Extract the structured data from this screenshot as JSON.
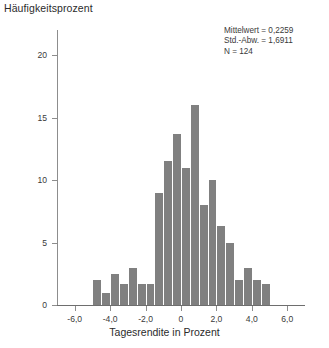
{
  "chart_data": {
    "type": "bar",
    "title": "",
    "subtitle": "",
    "ylabel": "Häufigkeitsprozent",
    "xlabel": "Tagesrendite in Prozent",
    "ylim": [
      0,
      22
    ],
    "xlim": [
      -7.0,
      7.0
    ],
    "grid": false,
    "legend": null,
    "y_ticks": [
      0,
      5,
      10,
      15,
      20
    ],
    "y_tick_labels": [
      "0",
      "5",
      "10",
      "15",
      "20"
    ],
    "x_ticks": [
      -6.0,
      -4.0,
      -2.0,
      0,
      2.0,
      4.0,
      6.0
    ],
    "x_tick_labels": [
      "-6,0",
      "-4,0",
      "-2,0",
      "0",
      "2,0",
      "4,0",
      "6,0"
    ],
    "bin_width": 0.5,
    "bar_color": "#808080",
    "bin_centers": [
      -4.75,
      -4.25,
      -3.75,
      -3.25,
      -2.75,
      -2.25,
      -1.75,
      -1.25,
      -0.75,
      -0.25,
      0.25,
      0.75,
      1.25,
      1.75,
      2.25,
      2.75,
      3.25,
      3.75,
      4.25,
      4.75
    ],
    "categories": [
      "-4,75",
      "-4,25",
      "-3,75",
      "-3,25",
      "-2,75",
      "-2,25",
      "-1,75",
      "-1,25",
      "-0,75",
      "-0,25",
      "0,25",
      "0,75",
      "1,25",
      "1,75",
      "2,25",
      "2,75",
      "3,25",
      "3,75",
      "4,25",
      "4,75"
    ],
    "values": [
      2.0,
      1.0,
      2.5,
      1.7,
      3.0,
      1.7,
      1.7,
      9.0,
      11.5,
      13.7,
      11.0,
      16.0,
      8.0,
      10.0,
      6.3,
      5.0,
      2.0,
      3.0,
      2.0,
      1.7
    ],
    "annotations": [
      "Mittelwert = 0,2259",
      "Std.-Abw. = 1,6911",
      "N = 124"
    ]
  },
  "stats": {
    "mean_line": "Mittelwert = 0,2259",
    "sd_line": "Std.-Abw. = 1,6911",
    "n_line": "N = 124"
  },
  "axes": {
    "y_title": "Häufigkeitsprozent",
    "x_title": "Tagesrendite in Prozent"
  }
}
